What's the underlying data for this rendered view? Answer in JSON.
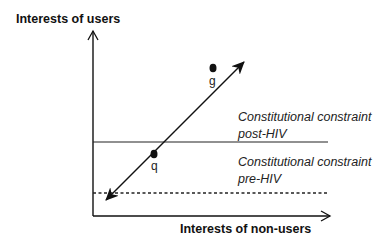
{
  "diagram": {
    "y_axis": {
      "label": "Interests of users"
    },
    "x_axis": {
      "label": "Interests of non-users"
    },
    "constraints": [
      {
        "line1": "Constitutional constraint",
        "line2": "post-HIV",
        "style": "solid"
      },
      {
        "line1": "Constitutional constraint",
        "line2": "pre-HIV",
        "style": "dashed"
      }
    ],
    "points": [
      {
        "name": "g"
      },
      {
        "name": "q"
      }
    ],
    "colors": {
      "ink": "#111111",
      "background": "#ffffff"
    }
  }
}
